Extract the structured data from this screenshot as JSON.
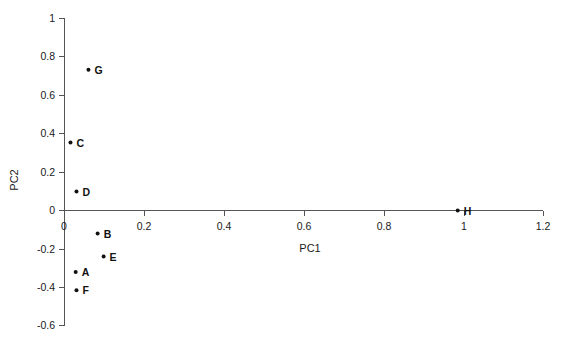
{
  "chart_data": {
    "type": "scatter",
    "title": "",
    "xlabel": "PC1",
    "ylabel": "PC2",
    "xlim": [
      -0.03,
      1.2
    ],
    "ylim": [
      -0.6,
      1.0
    ],
    "xticks": [
      0,
      0.2,
      0.4,
      0.6,
      0.8,
      1,
      1.2
    ],
    "xtick_labels": [
      "0",
      "0.2",
      "0.4",
      "0.6",
      "0.8",
      "1",
      "1.2"
    ],
    "yticks": [
      -0.6,
      -0.4,
      -0.2,
      0,
      0.2,
      0.4,
      0.6,
      0.8,
      1
    ],
    "ytick_labels": [
      "-0.6",
      "-0.4",
      "-0.2",
      "0",
      "0.2",
      "0.4",
      "0.6",
      "0.8",
      "1"
    ],
    "grid": false,
    "legend": "none",
    "points": [
      {
        "label": "A",
        "x": 0.028,
        "y": -0.32
      },
      {
        "label": "B",
        "x": 0.083,
        "y": -0.12
      },
      {
        "label": "C",
        "x": 0.015,
        "y": 0.354
      },
      {
        "label": "D",
        "x": 0.03,
        "y": 0.099
      },
      {
        "label": "E",
        "x": 0.098,
        "y": -0.24
      },
      {
        "label": "F",
        "x": 0.03,
        "y": -0.415
      },
      {
        "label": "G",
        "x": 0.06,
        "y": 0.734
      },
      {
        "label": "H",
        "x": 0.985,
        "y": 0
      }
    ]
  },
  "axes": {
    "x_axis_title": "PC1",
    "y_axis_title": "PC2"
  },
  "colors": {
    "background": "#ffffff",
    "axis": "#555555",
    "marker": "#111111",
    "text": "#1a1a1a"
  }
}
